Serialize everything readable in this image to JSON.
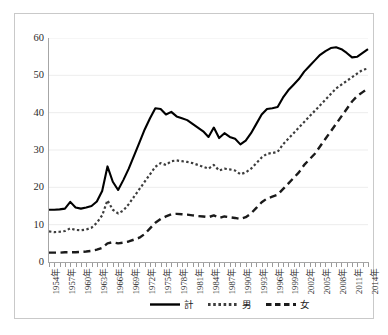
{
  "chart_data": {
    "type": "line",
    "title": "",
    "subtitle": "",
    "xlabel": "",
    "ylabel": "",
    "ylim": [
      0,
      60
    ],
    "ytick_step": 10,
    "ytick_labels": [
      "0",
      "10",
      "20",
      "30",
      "40",
      "50",
      "60"
    ],
    "grid": true,
    "grid_axis": "y",
    "legend_position": "bottom",
    "x": [
      1954,
      1955,
      1956,
      1957,
      1958,
      1959,
      1960,
      1961,
      1962,
      1963,
      1964,
      1965,
      1966,
      1967,
      1968,
      1969,
      1970,
      1971,
      1972,
      1973,
      1974,
      1975,
      1976,
      1977,
      1978,
      1979,
      1980,
      1981,
      1982,
      1983,
      1984,
      1985,
      1986,
      1987,
      1988,
      1989,
      1990,
      1991,
      1992,
      1993,
      1994,
      1995,
      1996,
      1997,
      1998,
      1999,
      2000,
      2001,
      2002,
      2003,
      2004,
      2005,
      2006,
      2007,
      2008,
      2009,
      2010,
      2011,
      2012,
      2013,
      2014
    ],
    "xtick_labels": [
      "1954年",
      "1957年",
      "1960年",
      "1963年",
      "1966年",
      "1969年",
      "1972年",
      "1975年",
      "1978年",
      "1981年",
      "1984年",
      "1987年",
      "1990年",
      "1993年",
      "1996年",
      "1999年",
      "2002年",
      "2005年",
      "2008年",
      "2011年",
      "2014年"
    ],
    "xtick_interval_years": 3,
    "series": [
      {
        "name": "計",
        "style": "solid",
        "color": "#000000",
        "values": [
          14.0,
          14.0,
          14.1,
          14.3,
          16.1,
          14.6,
          14.3,
          14.6,
          15.0,
          16.2,
          19.0,
          25.6,
          21.5,
          19.3,
          22.0,
          25.0,
          28.5,
          32.0,
          35.5,
          38.5,
          41.2,
          41.0,
          39.5,
          40.2,
          39.0,
          38.5,
          38.0,
          37.0,
          36.0,
          35.0,
          33.5,
          36.0,
          33.2,
          34.5,
          33.5,
          33.0,
          31.5,
          32.5,
          34.5,
          37.0,
          39.5,
          41.0,
          41.2,
          41.5,
          44.0,
          46.0,
          47.5,
          49.0,
          51.0,
          52.5,
          54.0,
          55.5,
          56.5,
          57.3,
          57.5,
          57.0,
          56.0,
          54.8,
          55.0,
          56.0,
          57.0
        ]
      },
      {
        "name": "男",
        "style": "dotted",
        "color": "#3d3d3d",
        "values": [
          8.2,
          8.0,
          8.1,
          8.3,
          9.0,
          8.6,
          8.5,
          8.7,
          9.2,
          10.5,
          12.5,
          16.5,
          14.0,
          13.0,
          13.8,
          15.5,
          17.5,
          19.5,
          21.5,
          23.5,
          25.5,
          26.5,
          26.0,
          27.0,
          27.2,
          27.0,
          26.8,
          26.5,
          26.0,
          25.5,
          25.0,
          26.0,
          24.5,
          25.0,
          24.8,
          24.5,
          23.5,
          24.0,
          25.0,
          26.5,
          28.0,
          29.0,
          29.2,
          29.5,
          31.5,
          33.0,
          34.5,
          36.0,
          37.5,
          39.0,
          40.5,
          42.0,
          43.5,
          45.0,
          46.5,
          47.5,
          48.5,
          49.5,
          50.5,
          51.5,
          51.8
        ]
      },
      {
        "name": "女",
        "style": "dashed",
        "color": "#1a1a1a",
        "values": [
          2.5,
          2.5,
          2.5,
          2.6,
          2.6,
          2.6,
          2.7,
          2.8,
          3.0,
          3.3,
          3.8,
          5.0,
          5.3,
          5.0,
          5.2,
          5.5,
          6.0,
          6.5,
          7.5,
          9.0,
          10.5,
          11.5,
          12.2,
          12.8,
          12.9,
          12.8,
          12.7,
          12.5,
          12.3,
          12.2,
          12.0,
          12.5,
          11.8,
          12.2,
          12.0,
          11.8,
          11.5,
          12.0,
          13.0,
          14.5,
          16.0,
          17.0,
          17.5,
          18.0,
          19.5,
          21.0,
          22.5,
          24.0,
          26.0,
          27.5,
          29.0,
          31.0,
          33.0,
          35.0,
          37.0,
          39.0,
          41.0,
          43.0,
          44.5,
          45.5,
          46.5
        ]
      }
    ]
  }
}
